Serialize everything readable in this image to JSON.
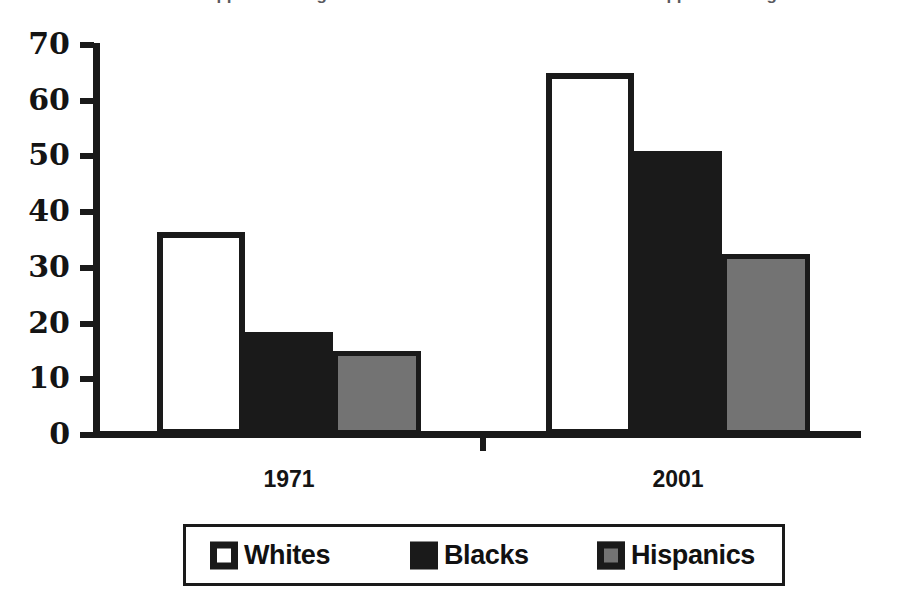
{
  "chart_data": {
    "type": "bar",
    "title": "",
    "xlabel": "",
    "ylabel": "",
    "categories": [
      "1971",
      "2001"
    ],
    "series": [
      {
        "name": "Whites",
        "color": "#ffffff",
        "values": [
          36.5,
          65
        ]
      },
      {
        "name": "Blacks",
        "color": "#1a1a1a",
        "values": [
          18.5,
          51
        ]
      },
      {
        "name": "Hispanics",
        "color": "#737373",
        "values": [
          15,
          32.5
        ]
      }
    ],
    "ylim": [
      0,
      70
    ],
    "yticks": [
      0,
      10,
      20,
      30,
      40,
      50,
      60,
      70
    ],
    "ytick_labels": [
      "0",
      "10",
      "20",
      "30",
      "40",
      "50",
      "60",
      "70"
    ],
    "grid": false,
    "legend_position": "bottom",
    "bar_outline_color": "#1a1a1a",
    "axis_color": "#1a1a1a",
    "background": "#ffffff"
  },
  "axis": {
    "ticks": [
      {
        "label": "70",
        "value": 70
      },
      {
        "label": "60",
        "value": 60
      },
      {
        "label": "50",
        "value": 50
      },
      {
        "label": "40",
        "value": 40
      },
      {
        "label": "30",
        "value": 30
      },
      {
        "label": "20",
        "value": 20
      },
      {
        "label": "10",
        "value": 10
      },
      {
        "label": "0",
        "value": 0
      }
    ]
  },
  "categories": [
    {
      "label": "1971"
    },
    {
      "label": "2001"
    }
  ],
  "legend": {
    "items": [
      {
        "label": "Whites",
        "swatch": "white-square-swatch"
      },
      {
        "label": "Blacks",
        "swatch": "black-square-swatch"
      },
      {
        "label": "Hispanics",
        "swatch": "gray-square-swatch"
      }
    ]
  },
  "cropped_title": {
    "text": "cropped heading text"
  }
}
